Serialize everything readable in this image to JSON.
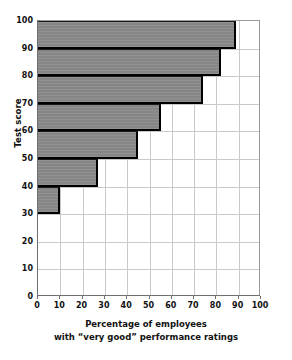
{
  "chart_data": {
    "type": "bar",
    "orientation": "horizontal",
    "title": "",
    "xlabel_line1": "Percentage of employees",
    "xlabel_line2": "with “very good” performance ratings",
    "ylabel": "Test score",
    "xlim": [
      0,
      100
    ],
    "ylim": [
      0,
      100
    ],
    "xticks": [
      "0",
      "10",
      "20",
      "30",
      "40",
      "50",
      "60",
      "70",
      "80",
      "90",
      "100"
    ],
    "yticks": [
      "0",
      "10",
      "20",
      "30",
      "40",
      "50",
      "60",
      "70",
      "80",
      "90",
      "100"
    ],
    "xtick_values": [
      0,
      10,
      20,
      30,
      40,
      50,
      60,
      70,
      80,
      90,
      100
    ],
    "ytick_values": [
      0,
      10,
      20,
      30,
      40,
      50,
      60,
      70,
      80,
      90,
      100
    ],
    "grid": true,
    "legend": "none",
    "bar_fill_color": "#8c8c8c",
    "bar_edge_color": "#000000",
    "grid_color": "#c9c9c9",
    "axis_color": "#6f6f6f",
    "bins": [
      {
        "label": "30-40",
        "bin_low": 30,
        "bin_high": 40,
        "value": 10
      },
      {
        "label": "40-50",
        "bin_low": 40,
        "bin_high": 50,
        "value": 27
      },
      {
        "label": "50-60",
        "bin_low": 50,
        "bin_high": 60,
        "value": 45
      },
      {
        "label": "60-70",
        "bin_low": 60,
        "bin_high": 70,
        "value": 55
      },
      {
        "label": "70-80",
        "bin_low": 70,
        "bin_high": 80,
        "value": 74
      },
      {
        "label": "80-90",
        "bin_low": 80,
        "bin_high": 90,
        "value": 82
      },
      {
        "label": "90-100",
        "bin_low": 90,
        "bin_high": 100,
        "value": 89
      }
    ],
    "categories": [
      "30-40",
      "40-50",
      "50-60",
      "60-70",
      "70-80",
      "80-90",
      "90-100"
    ],
    "values": [
      10,
      27,
      45,
      55,
      74,
      82,
      89
    ]
  }
}
